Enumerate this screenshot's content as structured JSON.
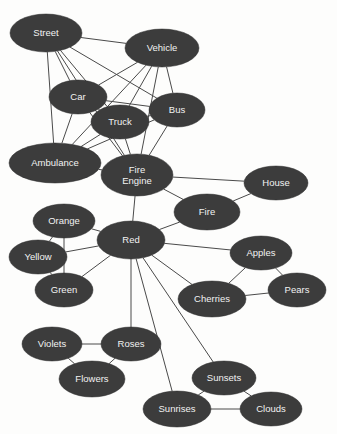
{
  "diagram": {
    "type": "node-link-graph",
    "background_color": "#fdfdfc",
    "node_fill_color": "#3c3c3c",
    "node_text_color": "#f2f2f2",
    "edge_color": "#4a4a4a",
    "width": 337,
    "height": 434
  },
  "nodes": [
    {
      "id": "street",
      "label": "Street",
      "cx": 46,
      "cy": 33,
      "rx": 36,
      "ry": 19
    },
    {
      "id": "vehicle",
      "label": "Vehicle",
      "cx": 162,
      "cy": 48,
      "rx": 37,
      "ry": 19
    },
    {
      "id": "car",
      "label": "Car",
      "cx": 78,
      "cy": 97,
      "rx": 29,
      "ry": 17
    },
    {
      "id": "bus",
      "label": "Bus",
      "cx": 177,
      "cy": 110,
      "rx": 28,
      "ry": 17
    },
    {
      "id": "truck",
      "label": "Truck",
      "cx": 120,
      "cy": 122,
      "rx": 29,
      "ry": 17
    },
    {
      "id": "ambulance",
      "label": "Ambulance",
      "cx": 55,
      "cy": 163,
      "rx": 46,
      "ry": 20
    },
    {
      "id": "fireengine",
      "label": "Fire Engine",
      "label_line1": "Fire",
      "label_line2": "Engine",
      "cx": 137,
      "cy": 175,
      "rx": 36,
      "ry": 21
    },
    {
      "id": "house",
      "label": "House",
      "cx": 276,
      "cy": 183,
      "rx": 32,
      "ry": 17
    },
    {
      "id": "fire",
      "label": "Fire",
      "cx": 207,
      "cy": 212,
      "rx": 33,
      "ry": 18
    },
    {
      "id": "orange",
      "label": "Orange",
      "cx": 64,
      "cy": 221,
      "rx": 31,
      "ry": 17
    },
    {
      "id": "red",
      "label": "Red",
      "cx": 131,
      "cy": 240,
      "rx": 34,
      "ry": 19
    },
    {
      "id": "yellow",
      "label": "Yellow",
      "cx": 38,
      "cy": 257,
      "rx": 29,
      "ry": 17
    },
    {
      "id": "apples",
      "label": "Apples",
      "cx": 261,
      "cy": 253,
      "rx": 31,
      "ry": 17
    },
    {
      "id": "green",
      "label": "Green",
      "cx": 64,
      "cy": 290,
      "rx": 29,
      "ry": 17
    },
    {
      "id": "pears",
      "label": "Pears",
      "cx": 297,
      "cy": 290,
      "rx": 29,
      "ry": 17
    },
    {
      "id": "cherries",
      "label": "Cherries",
      "cx": 212,
      "cy": 299,
      "rx": 34,
      "ry": 18
    },
    {
      "id": "violets",
      "label": "Violets",
      "cx": 52,
      "cy": 344,
      "rx": 30,
      "ry": 17
    },
    {
      "id": "roses",
      "label": "Roses",
      "cx": 131,
      "cy": 344,
      "rx": 30,
      "ry": 17
    },
    {
      "id": "flowers",
      "label": "Flowers",
      "cx": 92,
      "cy": 379,
      "rx": 33,
      "ry": 18
    },
    {
      "id": "sunsets",
      "label": "Sunsets",
      "cx": 224,
      "cy": 378,
      "rx": 32,
      "ry": 17
    },
    {
      "id": "sunrises",
      "label": "Sunrises",
      "cx": 177,
      "cy": 409,
      "rx": 34,
      "ry": 18
    },
    {
      "id": "clouds",
      "label": "Clouds",
      "cx": 271,
      "cy": 409,
      "rx": 31,
      "ry": 17
    }
  ],
  "edges": [
    {
      "source": "street",
      "target": "vehicle"
    },
    {
      "source": "street",
      "target": "car"
    },
    {
      "source": "street",
      "target": "truck"
    },
    {
      "source": "street",
      "target": "bus"
    },
    {
      "source": "street",
      "target": "ambulance"
    },
    {
      "source": "street",
      "target": "fireengine"
    },
    {
      "source": "vehicle",
      "target": "car"
    },
    {
      "source": "vehicle",
      "target": "truck"
    },
    {
      "source": "vehicle",
      "target": "bus"
    },
    {
      "source": "vehicle",
      "target": "ambulance"
    },
    {
      "source": "vehicle",
      "target": "fireengine"
    },
    {
      "source": "car",
      "target": "truck"
    },
    {
      "source": "car",
      "target": "bus"
    },
    {
      "source": "car",
      "target": "ambulance"
    },
    {
      "source": "car",
      "target": "fireengine"
    },
    {
      "source": "truck",
      "target": "bus"
    },
    {
      "source": "truck",
      "target": "ambulance"
    },
    {
      "source": "truck",
      "target": "fireengine"
    },
    {
      "source": "bus",
      "target": "ambulance"
    },
    {
      "source": "bus",
      "target": "fireengine"
    },
    {
      "source": "ambulance",
      "target": "fireengine"
    },
    {
      "source": "fireengine",
      "target": "house"
    },
    {
      "source": "fireengine",
      "target": "fire"
    },
    {
      "source": "fireengine",
      "target": "red"
    },
    {
      "source": "house",
      "target": "fire"
    },
    {
      "source": "fire",
      "target": "red"
    },
    {
      "source": "red",
      "target": "orange"
    },
    {
      "source": "red",
      "target": "yellow"
    },
    {
      "source": "red",
      "target": "green"
    },
    {
      "source": "red",
      "target": "apples"
    },
    {
      "source": "red",
      "target": "cherries"
    },
    {
      "source": "red",
      "target": "roses"
    },
    {
      "source": "red",
      "target": "sunsets"
    },
    {
      "source": "red",
      "target": "sunrises"
    },
    {
      "source": "orange",
      "target": "yellow"
    },
    {
      "source": "orange",
      "target": "green"
    },
    {
      "source": "yellow",
      "target": "green"
    },
    {
      "source": "apples",
      "target": "pears"
    },
    {
      "source": "apples",
      "target": "cherries"
    },
    {
      "source": "cherries",
      "target": "pears"
    },
    {
      "source": "violets",
      "target": "roses"
    },
    {
      "source": "violets",
      "target": "flowers"
    },
    {
      "source": "roses",
      "target": "flowers"
    },
    {
      "source": "sunsets",
      "target": "sunrises"
    },
    {
      "source": "sunsets",
      "target": "clouds"
    },
    {
      "source": "sunrises",
      "target": "clouds"
    }
  ]
}
